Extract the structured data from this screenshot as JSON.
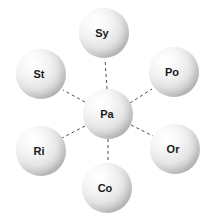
{
  "diagram": {
    "type": "hub-and-spoke",
    "title": "",
    "background_color": "#ffffff",
    "node_style": {
      "shape": "sphere",
      "fill_light": "#ffffff",
      "fill_mid": "#e6e6e6",
      "fill_dark": "#7d7d7d",
      "label_color": "#1a1a1a"
    },
    "edge_style": {
      "line_style": "dashed",
      "color": "#4d4d4d",
      "width": 1,
      "dash_pattern": "3,3"
    },
    "hub": {
      "id": "pa",
      "label": "Pa",
      "cx": 108,
      "cy": 114,
      "r": 25
    },
    "spokes": [
      {
        "id": "sy",
        "label": "Sy",
        "cx": 104,
        "cy": 33,
        "r": 25,
        "position": "top"
      },
      {
        "id": "po",
        "label": "Po",
        "cx": 174,
        "cy": 72,
        "r": 25,
        "position": "upper-right"
      },
      {
        "id": "or",
        "label": "Or",
        "cx": 175,
        "cy": 149,
        "r": 25,
        "position": "lower-right"
      },
      {
        "id": "co",
        "label": "Co",
        "cx": 107,
        "cy": 188,
        "r": 25,
        "position": "bottom"
      },
      {
        "id": "ri",
        "label": "Ri",
        "cx": 41,
        "cy": 151,
        "r": 25,
        "position": "lower-left"
      },
      {
        "id": "st",
        "label": "St",
        "cx": 41,
        "cy": 74,
        "r": 25,
        "position": "upper-left"
      }
    ],
    "edges": [
      {
        "from": "pa",
        "to": "sy",
        "x1": 107,
        "y1": 89,
        "x2": 105,
        "y2": 59
      },
      {
        "from": "pa",
        "to": "po",
        "x1": 130,
        "y1": 103,
        "x2": 152,
        "y2": 89
      },
      {
        "from": "pa",
        "to": "or",
        "x1": 131,
        "y1": 125,
        "x2": 153,
        "y2": 136
      },
      {
        "from": "pa",
        "to": "co",
        "x1": 108,
        "y1": 139,
        "x2": 108,
        "y2": 164
      },
      {
        "from": "pa",
        "to": "ri",
        "x1": 85,
        "y1": 126,
        "x2": 62,
        "y2": 138
      },
      {
        "from": "pa",
        "to": "st",
        "x1": 85,
        "y1": 102,
        "x2": 63,
        "y2": 90
      }
    ]
  }
}
